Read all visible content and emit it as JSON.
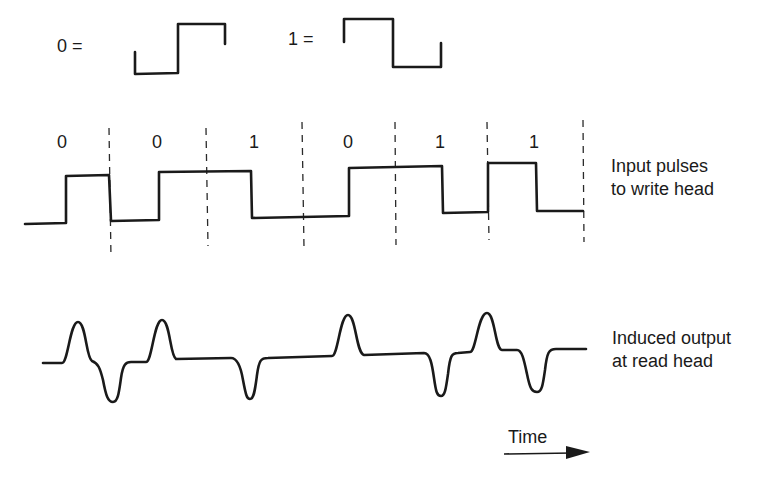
{
  "legend": {
    "zero_label": "0 =",
    "one_label": "1 ="
  },
  "bit_sequence": [
    "0",
    "0",
    "1",
    "0",
    "1",
    "1"
  ],
  "labels": {
    "input_line1": "Input pulses",
    "input_line2": "to write head",
    "output_line1": "Induced output",
    "output_line2": "at read head",
    "time": "Time"
  },
  "colors": {
    "ink": "#1a1a1a",
    "background": "#ffffff"
  }
}
